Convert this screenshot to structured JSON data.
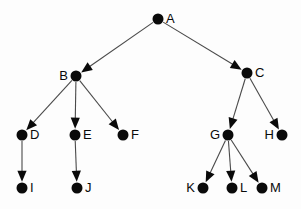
{
  "diagram": {
    "background_color": "#fdfdfd",
    "node_color": "#0a0a0a",
    "edge_color": "#4a4a4a",
    "label_color": "#0a0a0a",
    "node_radius": 5.5,
    "nodes": [
      {
        "id": "A",
        "label": "A",
        "x": 158,
        "y": 19,
        "label_side": "right"
      },
      {
        "id": "B",
        "label": "B",
        "x": 76,
        "y": 76,
        "label_side": "left"
      },
      {
        "id": "C",
        "label": "C",
        "x": 247,
        "y": 73,
        "label_side": "right"
      },
      {
        "id": "D",
        "label": "D",
        "x": 22,
        "y": 135,
        "label_side": "right"
      },
      {
        "id": "E",
        "label": "E",
        "x": 75,
        "y": 135,
        "label_side": "right"
      },
      {
        "id": "F",
        "label": "F",
        "x": 123,
        "y": 135,
        "label_side": "right"
      },
      {
        "id": "G",
        "label": "G",
        "x": 228,
        "y": 135,
        "label_side": "left"
      },
      {
        "id": "H",
        "label": "H",
        "x": 282,
        "y": 135,
        "label_side": "left"
      },
      {
        "id": "I",
        "label": "I",
        "x": 22,
        "y": 188,
        "label_side": "right"
      },
      {
        "id": "J",
        "label": "J",
        "x": 77,
        "y": 188,
        "label_side": "right"
      },
      {
        "id": "K",
        "label": "K",
        "x": 203,
        "y": 188,
        "label_side": "left"
      },
      {
        "id": "L",
        "label": "L",
        "x": 232,
        "y": 188,
        "label_side": "right"
      },
      {
        "id": "M",
        "label": "M",
        "x": 262,
        "y": 188,
        "label_side": "right"
      }
    ],
    "edges": [
      {
        "from": "A",
        "to": "B",
        "directed": true
      },
      {
        "from": "A",
        "to": "C",
        "directed": true
      },
      {
        "from": "B",
        "to": "D",
        "directed": true
      },
      {
        "from": "B",
        "to": "E",
        "directed": true
      },
      {
        "from": "B",
        "to": "F",
        "directed": true
      },
      {
        "from": "C",
        "to": "G",
        "directed": true
      },
      {
        "from": "C",
        "to": "H",
        "directed": true
      },
      {
        "from": "D",
        "to": "I",
        "directed": true
      },
      {
        "from": "E",
        "to": "J",
        "directed": true
      },
      {
        "from": "G",
        "to": "K",
        "directed": true
      },
      {
        "from": "G",
        "to": "L",
        "directed": true
      },
      {
        "from": "G",
        "to": "M",
        "directed": true
      }
    ]
  }
}
